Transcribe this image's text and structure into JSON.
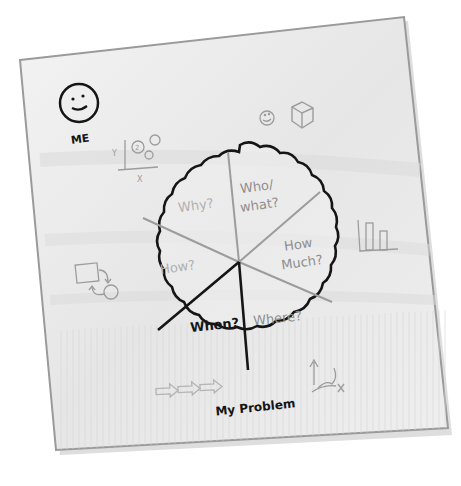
{
  "napkin": {
    "colors": {
      "paper": "#ececec",
      "paper_light": "#f6f6f6",
      "edge": "#9a9a9a",
      "ink": "#151515",
      "pencil": "#9c9c9c"
    }
  },
  "me": {
    "label": "ME",
    "icon": "smiley-face-icon"
  },
  "doodles": {
    "scatter_plot": {
      "y_label": "Y",
      "x_label": "X",
      "bubble_label": "2"
    },
    "small_smiley": "smiley-icon",
    "cube": "cube-icon",
    "bar_chart": "bar-chart-icon",
    "flow_diagram": "flow-diagram-icon",
    "arrows": "arrows-icon",
    "timeline": "up-arrow-squiggle-icon"
  },
  "pie": {
    "title": "My Problem",
    "segments": [
      {
        "label_line1": "Who/",
        "label_line2": "what?",
        "style": "pencil"
      },
      {
        "label_line1": "How",
        "label_line2": "Much?",
        "style": "pencil"
      },
      {
        "label_line1": "Where?",
        "label_line2": "",
        "style": "pencil"
      },
      {
        "label_line1": "When?",
        "label_line2": "",
        "style": "ink"
      },
      {
        "label_line1": "How?",
        "label_line2": "",
        "style": "pencil"
      },
      {
        "label_line1": "Why?",
        "label_line2": "",
        "style": "pencil"
      }
    ]
  }
}
